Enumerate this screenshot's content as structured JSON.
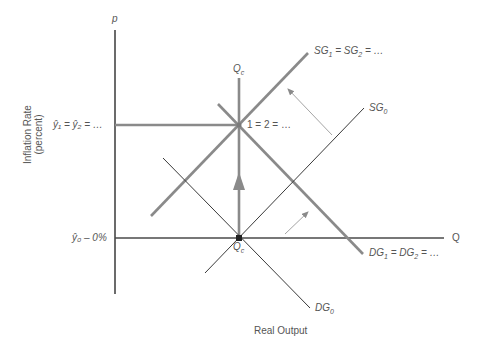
{
  "diagram": {
    "type": "supply-demand-growth",
    "colors": {
      "axis": "#6b6b6b",
      "thick_line": "#8a8a8a",
      "thin_line": "#3a3a3a",
      "shift_arrow": "#9a9a9a",
      "label": "#555555"
    }
  },
  "axes": {
    "y_symbol": "p",
    "x_symbol": "Q",
    "y_title_line1": "Inflation Rate",
    "y_title_line2": "(percent)",
    "x_title": "Real Output"
  },
  "ticks": {
    "y_upper": "ŷ₁ = ŷ₂ = …",
    "y_lower": "ŷ₀ – 0%"
  },
  "points": {
    "qc_top": "Q",
    "qc_top_sub": "c",
    "qc_bottom": "Q",
    "qc_bottom_sub": "c",
    "equilibrium_upper": "1 = 2 = …"
  },
  "curves": {
    "sg1": {
      "name": "SG",
      "sub": "1",
      "rest": " = SG",
      "sub2": "2",
      "tail": " = …"
    },
    "sg0": {
      "name": "SG",
      "sub": "0"
    },
    "dg1": {
      "name": "DG",
      "sub": "1",
      "rest": " = DG",
      "sub2": "2",
      "tail": " = …"
    },
    "dg0": {
      "name": "DG",
      "sub": "0"
    }
  }
}
